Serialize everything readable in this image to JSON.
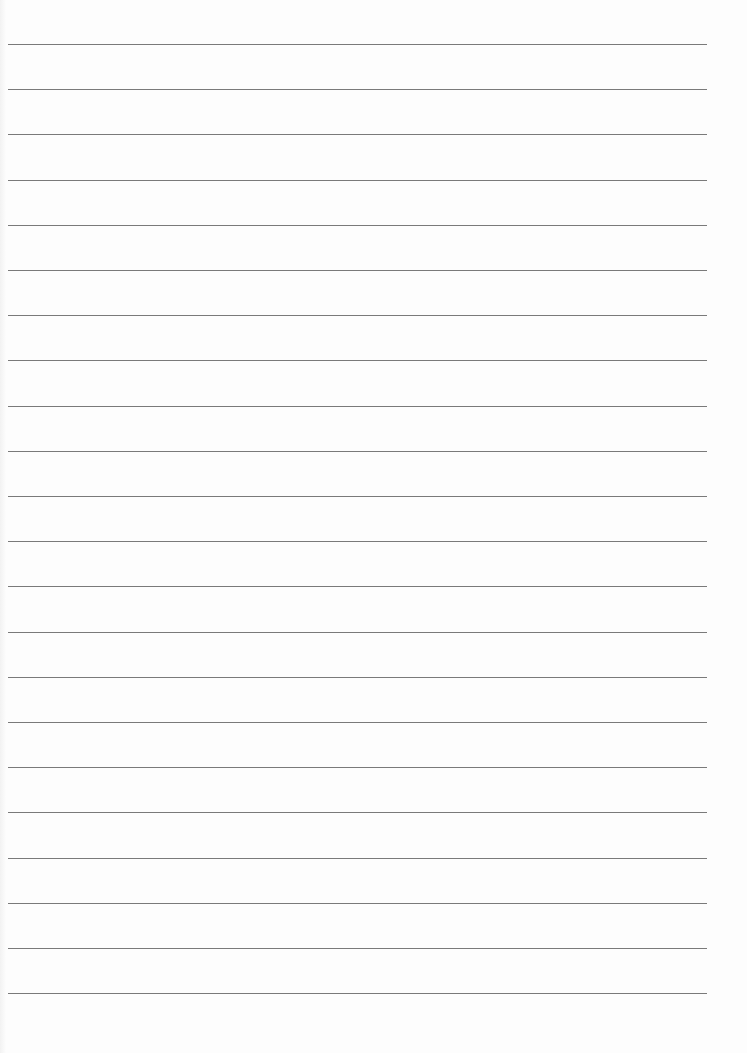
{
  "document": {
    "type": "lined-paper",
    "line_count": 22,
    "line_color": "#7a7a7a",
    "background_color": "#fdfdfd",
    "first_line_y": 44,
    "line_spacing": 45.2,
    "line_left": 8,
    "line_width": 699
  }
}
